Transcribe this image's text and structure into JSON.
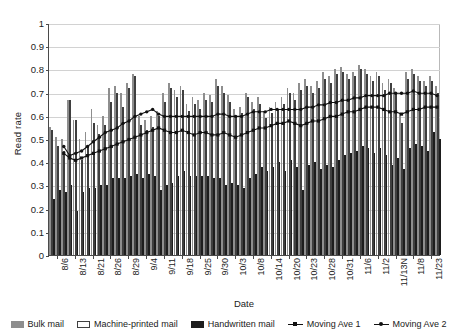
{
  "chart_data": {
    "type": "bar",
    "title": "",
    "xlabel": "Date",
    "ylabel": "Read rate",
    "ylim": [
      0,
      1
    ],
    "ytick_labels": [
      "0",
      "0.1",
      "0.2",
      "0.3",
      "0.4",
      "0.5",
      "0.6",
      "0.7",
      "0.8",
      "0.9",
      "1"
    ],
    "ytick_values": [
      0,
      0.1,
      0.2,
      0.3,
      0.4,
      0.5,
      0.6,
      0.7,
      0.8,
      0.9,
      1
    ],
    "grid": true,
    "legend_position": "bottom",
    "xtick_labels": [
      "8/6",
      "8/13",
      "8/21",
      "8/26",
      "8/29",
      "9/4",
      "9/11",
      "9/18",
      "9/25",
      "9/30",
      "10/3",
      "10/8",
      "10/14",
      "10/20",
      "10/23",
      "10/28",
      "10/31",
      "11/6",
      "11/2",
      "11/13N",
      "11/8",
      "11/23"
    ],
    "xtick_indices": [
      0,
      3,
      6,
      9,
      12,
      15,
      18,
      21,
      24,
      27,
      30,
      33,
      36,
      39,
      42,
      45,
      48,
      51,
      54,
      57,
      60,
      63
    ],
    "categories": [
      "8/6",
      "8/7",
      "8/8",
      "8/13",
      "8/14",
      "8/15",
      "8/21",
      "8/22",
      "8/23",
      "8/26",
      "8/27",
      "8/28",
      "8/29",
      "8/30",
      "9/1",
      "9/4",
      "9/5",
      "9/6",
      "9/11",
      "9/12",
      "9/13",
      "9/18",
      "9/19",
      "9/20",
      "9/25",
      "9/26",
      "9/27",
      "9/30",
      "10/1",
      "10/2",
      "10/3",
      "10/4",
      "10/5",
      "10/8",
      "10/9",
      "10/10",
      "10/14",
      "10/15",
      "10/16",
      "10/20",
      "10/21",
      "10/22",
      "10/23",
      "10/24",
      "10/25",
      "10/28",
      "10/29",
      "10/30",
      "10/31",
      "11/1",
      "11/2",
      "11/6",
      "11/7",
      "11/8",
      "11/2b",
      "11/3",
      "11/4",
      "11/13N",
      "11/14",
      "11/15",
      "11/8b",
      "11/9",
      "11/10",
      "11/23",
      "11/24",
      "11/25"
    ],
    "series": [
      {
        "name": "Bulk mail",
        "color": "#8e8e8e",
        "values": [
          0.55,
          0.51,
          0.5,
          0.67,
          0.58,
          0.5,
          0.53,
          0.63,
          0.56,
          0.6,
          0.72,
          0.73,
          0.7,
          0.74,
          0.78,
          0.6,
          0.58,
          0.6,
          0.62,
          0.7,
          0.74,
          0.71,
          0.73,
          0.65,
          0.68,
          0.67,
          0.7,
          0.69,
          0.76,
          0.73,
          0.69,
          0.63,
          0.64,
          0.7,
          0.66,
          0.68,
          0.62,
          0.64,
          0.66,
          0.68,
          0.72,
          0.7,
          0.74,
          0.76,
          0.73,
          0.75,
          0.79,
          0.77,
          0.8,
          0.81,
          0.78,
          0.79,
          0.82,
          0.8,
          0.77,
          0.79,
          0.74,
          0.76,
          0.72,
          0.61,
          0.79,
          0.8,
          0.77,
          0.75,
          0.77,
          0.73
        ]
      },
      {
        "name": "Machine-printed mail",
        "color": "#fbfbfb",
        "values": [
          0.54,
          0.47,
          0.45,
          0.67,
          0.58,
          0.41,
          0.47,
          0.57,
          0.52,
          0.56,
          0.66,
          0.7,
          0.64,
          0.72,
          0.77,
          0.56,
          0.54,
          0.55,
          0.6,
          0.66,
          0.72,
          0.68,
          0.71,
          0.62,
          0.65,
          0.63,
          0.67,
          0.66,
          0.73,
          0.7,
          0.66,
          0.6,
          0.61,
          0.68,
          0.63,
          0.65,
          0.59,
          0.61,
          0.63,
          0.65,
          0.7,
          0.67,
          0.71,
          0.73,
          0.7,
          0.72,
          0.76,
          0.74,
          0.78,
          0.79,
          0.76,
          0.77,
          0.8,
          0.78,
          0.75,
          0.77,
          0.71,
          0.74,
          0.7,
          0.57,
          0.76,
          0.78,
          0.75,
          0.73,
          0.75,
          0.7
        ]
      },
      {
        "name": "Handwritten mail",
        "color": "#1d1d1d",
        "values": [
          0.24,
          0.28,
          0.27,
          0.3,
          0.19,
          0.27,
          0.29,
          0.29,
          0.3,
          0.3,
          0.33,
          0.33,
          0.33,
          0.34,
          0.35,
          0.33,
          0.35,
          0.34,
          0.28,
          0.3,
          0.31,
          0.34,
          0.36,
          0.34,
          0.34,
          0.34,
          0.34,
          0.33,
          0.33,
          0.3,
          0.31,
          0.3,
          0.29,
          0.33,
          0.35,
          0.38,
          0.36,
          0.38,
          0.4,
          0.36,
          0.41,
          0.38,
          0.28,
          0.39,
          0.4,
          0.37,
          0.39,
          0.38,
          0.41,
          0.43,
          0.44,
          0.45,
          0.47,
          0.46,
          0.44,
          0.46,
          0.43,
          0.39,
          0.42,
          0.37,
          0.46,
          0.48,
          0.47,
          0.45,
          0.53,
          0.5
        ]
      }
    ],
    "moving_averages": [
      {
        "name": "Moving Ave 1",
        "marker": "square",
        "values": [
          null,
          null,
          0.44,
          0.42,
          0.41,
          0.42,
          0.43,
          0.44,
          0.45,
          0.46,
          0.47,
          0.48,
          0.49,
          0.5,
          0.51,
          0.52,
          0.53,
          0.54,
          0.55,
          0.54,
          0.53,
          0.53,
          0.54,
          0.53,
          0.52,
          0.53,
          0.53,
          0.52,
          0.52,
          0.53,
          0.52,
          0.51,
          0.52,
          0.53,
          0.54,
          0.55,
          0.55,
          0.56,
          0.57,
          0.57,
          0.58,
          0.57,
          0.56,
          0.57,
          0.58,
          0.58,
          0.59,
          0.6,
          0.6,
          0.61,
          0.62,
          0.62,
          0.63,
          0.64,
          0.64,
          0.64,
          0.63,
          0.62,
          0.62,
          0.61,
          0.62,
          0.63,
          0.63,
          0.64,
          0.64,
          0.64
        ]
      },
      {
        "name": "Moving Ave 2",
        "marker": "circle",
        "values": [
          null,
          null,
          0.47,
          0.43,
          0.44,
          0.45,
          0.47,
          0.49,
          0.51,
          0.53,
          0.54,
          0.55,
          0.57,
          0.58,
          0.6,
          0.61,
          0.62,
          0.63,
          0.61,
          0.6,
          0.6,
          0.6,
          0.6,
          0.6,
          0.6,
          0.6,
          0.6,
          0.6,
          0.61,
          0.61,
          0.6,
          0.6,
          0.6,
          0.61,
          0.62,
          0.62,
          0.62,
          0.63,
          0.63,
          0.63,
          0.63,
          0.63,
          0.63,
          0.64,
          0.64,
          0.65,
          0.65,
          0.66,
          0.66,
          0.67,
          0.67,
          0.68,
          0.68,
          0.69,
          0.69,
          0.69,
          0.69,
          0.7,
          0.7,
          0.7,
          0.7,
          0.71,
          0.7,
          0.7,
          0.7,
          0.69
        ]
      }
    ]
  },
  "legend": {
    "items": [
      {
        "label": "Bulk mail",
        "kind": "bulk"
      },
      {
        "label": "Machine-printed mail",
        "kind": "machine"
      },
      {
        "label": "Handwritten mail",
        "kind": "hand"
      },
      {
        "label": "Moving Ave 1",
        "kind": "line1"
      },
      {
        "label": "Moving Ave 2",
        "kind": "line2"
      }
    ]
  }
}
